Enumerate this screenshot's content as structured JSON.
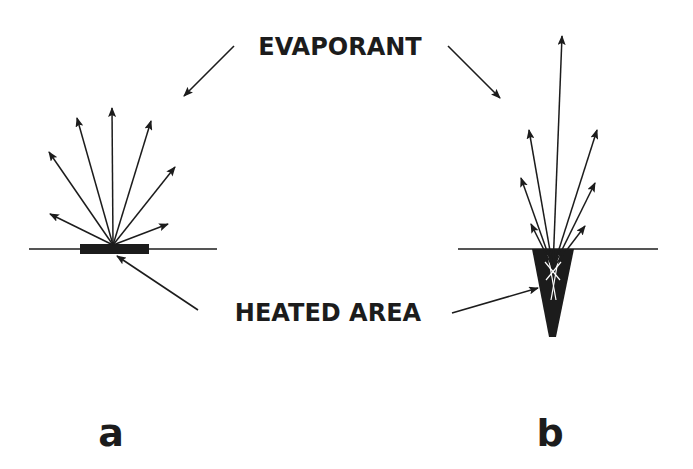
{
  "diagram": {
    "labels": {
      "evaporant": "EVAPORANT",
      "heated_area": "HEATED AREA",
      "panel_a": "a",
      "panel_b": "b"
    },
    "colors": {
      "ink": "#1c1c1c",
      "background": "#ffffff"
    },
    "panels": [
      {
        "id": "a",
        "description": "Flat heated area on surface; evaporant emitted in a broad fan",
        "heated_shape": "flat-bar",
        "arrow_count": 7
      },
      {
        "id": "b",
        "description": "V-shaped heated cavity; evaporant emitted in a narrow collimated plume",
        "heated_shape": "v-groove",
        "arrow_count": 7
      }
    ]
  }
}
